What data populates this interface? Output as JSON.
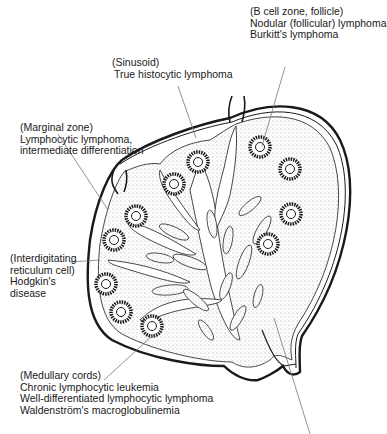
{
  "labels": {
    "b_cell_zone": {
      "zone": "(B cell zone, follicle)",
      "lines": [
        "Nodular (follicular) lymphoma",
        "Burkitt's lymphoma"
      ]
    },
    "sinusoid": {
      "zone": "(Sinusoid)",
      "lines": [
        "True histocytic lymphoma"
      ]
    },
    "marginal_zone": {
      "zone": "(Marginal zone)",
      "lines": [
        "Lymphocytic lymphoma,",
        "intermediate differentiation"
      ]
    },
    "interdigitating": {
      "zone": "(Interdigitating",
      "lines": [
        "reticulum cell)",
        "Hodgkin's",
        "disease"
      ]
    },
    "medullary_cords": {
      "zone": "(Medullary cords)",
      "lines": [
        "Chronic lymphocytic leukemia",
        "Well-differentiated lymphocytic lymphoma",
        "Waldenström's macroglobulinemia"
      ]
    }
  },
  "colors": {
    "ink": "#1a1a1a",
    "stipple": "#cfcfcf",
    "leader": "#777777"
  }
}
